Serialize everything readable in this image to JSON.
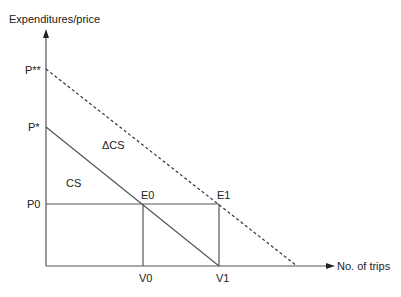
{
  "diagram": {
    "type": "consumer-surplus-demand-diagram",
    "y_axis_label": "Expenditures/price",
    "x_axis_label": "No. of trips",
    "price_labels": {
      "p_double_star": "P**",
      "p_star": "P*",
      "p0": "P0"
    },
    "quantity_labels": {
      "v0": "V0",
      "v1": "V1"
    },
    "points": {
      "e0": "E0",
      "e1": "E1"
    },
    "regions": {
      "cs": "CS",
      "delta_cs": "ΔCS"
    },
    "lines": [
      {
        "name": "original-demand",
        "style": "solid",
        "from": "P*",
        "to": "V1"
      },
      {
        "name": "shifted-demand",
        "style": "dashed",
        "from": "P**",
        "to": "x-axis"
      },
      {
        "name": "price-line",
        "style": "solid",
        "from": "P0",
        "to": "E1"
      },
      {
        "name": "v0-drop",
        "style": "solid",
        "from": "E0",
        "to": "V0"
      },
      {
        "name": "v1-drop",
        "style": "solid",
        "from": "E1",
        "to": "V1"
      }
    ],
    "colors": {
      "line": "#555555",
      "text": "#222222",
      "background": "#ffffff"
    }
  }
}
